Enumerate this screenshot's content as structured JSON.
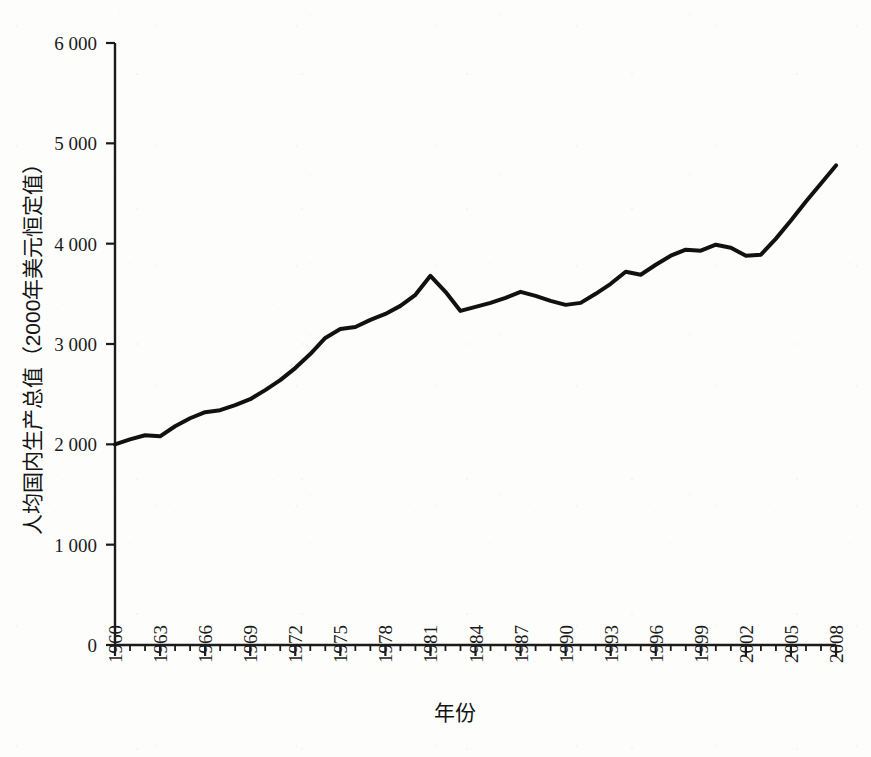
{
  "chart_data": {
    "type": "line",
    "title": "",
    "xlabel": "年份",
    "ylabel": "人均国内生产总值（2000年美元恒定值）",
    "xlim": [
      1960,
      2008
    ],
    "ylim": [
      0,
      6000
    ],
    "grid": false,
    "legend": null,
    "y_ticks": [
      0,
      1000,
      2000,
      3000,
      4000,
      5000,
      6000
    ],
    "y_tick_labels": [
      "0",
      "1 000",
      "2 000",
      "3 000",
      "4 000",
      "5 000",
      "6 000"
    ],
    "x_ticks": [
      1960,
      1963,
      1966,
      1969,
      1972,
      1975,
      1978,
      1981,
      1984,
      1987,
      1990,
      1993,
      1996,
      1999,
      2002,
      2005,
      2008
    ],
    "x_tick_labels": [
      "1960",
      "1963",
      "1966",
      "1969",
      "1972",
      "1975",
      "1978",
      "1981",
      "1984",
      "1987",
      "1990",
      "1993",
      "1996",
      "1999",
      "2002",
      "2005",
      "2008"
    ],
    "x_minor_tick_interval": 1,
    "line_color": "#111111",
    "line_width": 4,
    "x": [
      1960,
      1961,
      1962,
      1963,
      1964,
      1965,
      1966,
      1967,
      1968,
      1969,
      1970,
      1971,
      1972,
      1973,
      1974,
      1975,
      1976,
      1977,
      1978,
      1979,
      1980,
      1981,
      1982,
      1983,
      1984,
      1985,
      1986,
      1987,
      1988,
      1989,
      1990,
      1991,
      1992,
      1993,
      1994,
      1995,
      1996,
      1997,
      1998,
      1999,
      2000,
      2001,
      2002,
      2003,
      2004,
      2005,
      2006,
      2007,
      2008
    ],
    "values": [
      2000,
      2050,
      2090,
      2080,
      2180,
      2260,
      2320,
      2340,
      2390,
      2450,
      2540,
      2640,
      2760,
      2900,
      3060,
      3150,
      3170,
      3240,
      3300,
      3380,
      3490,
      3680,
      3520,
      3330,
      3370,
      3410,
      3460,
      3520,
      3480,
      3430,
      3390,
      3410,
      3500,
      3600,
      3720,
      3690,
      3790,
      3880,
      3940,
      3930,
      3990,
      3960,
      3880,
      3890,
      4050,
      4230,
      4420,
      4600,
      4780
    ],
    "series_name": "人均国内生产总值",
    "annotations": []
  },
  "figure": {
    "background_color": "#fdfdfb",
    "axis_color": "#1b1b1b"
  }
}
